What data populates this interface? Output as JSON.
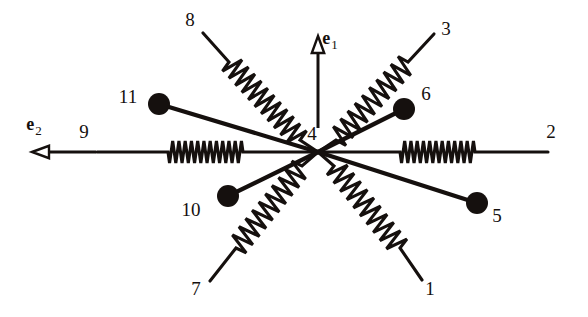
{
  "figure": {
    "background_color": "#ffffff",
    "ink_color": "#15100e",
    "width": 588,
    "height": 317
  },
  "hub": {
    "label": "4",
    "label_x": 312,
    "label_y": 140,
    "center_x": 318,
    "center_y": 152
  },
  "basis_vectors": [
    {
      "name": "e1",
      "letter": "e",
      "subscript": "1",
      "direction": "up",
      "tail_x": 318,
      "tail_y": 128,
      "head_x": 318,
      "head_y": 36,
      "letter_x": 330,
      "letter_y": 44,
      "arrowhead": "hollow-triangle"
    },
    {
      "name": "e2",
      "letter": "e",
      "subscript": "2",
      "direction": "left",
      "tail_x": 96,
      "tail_y": 152,
      "head_x": 32,
      "head_y": 152,
      "letter_x": 34,
      "letter_y": 130,
      "arrowhead": "hollow-triangle"
    }
  ],
  "springs": [
    {
      "label": "8",
      "label_x": 190,
      "label_y": 26,
      "tip_x": 203,
      "tip_y": 33,
      "coil_start_x": 229,
      "coil_start_y": 62,
      "coil_end_x": 300,
      "coil_end_y": 140,
      "hub_x": 318,
      "hub_y": 152,
      "coils": 11,
      "amplitude": 11
    },
    {
      "label": "3",
      "label_x": 446,
      "label_y": 35,
      "tip_x": 434,
      "tip_y": 34,
      "coil_start_x": 408,
      "coil_start_y": 62,
      "coil_end_x": 336,
      "coil_end_y": 140,
      "hub_x": 318,
      "hub_y": 152,
      "coils": 10,
      "amplitude": 11
    },
    {
      "label": "7",
      "label_x": 196,
      "label_y": 295,
      "tip_x": 210,
      "tip_y": 281,
      "coil_start_x": 236,
      "coil_start_y": 248,
      "coil_end_x": 302,
      "coil_end_y": 166,
      "hub_x": 318,
      "hub_y": 152,
      "coils": 10,
      "amplitude": 11
    },
    {
      "label": "1",
      "label_x": 430,
      "label_y": 295,
      "tip_x": 422,
      "tip_y": 280,
      "coil_start_x": 400,
      "coil_start_y": 248,
      "coil_end_x": 334,
      "coil_end_y": 166,
      "hub_x": 318,
      "hub_y": 152,
      "coils": 10,
      "amplitude": 11
    },
    {
      "label": "9",
      "label_x": 84,
      "label_y": 138,
      "tip_x": 97,
      "tip_y": 152,
      "coil_start_x": 168,
      "coil_start_y": 152,
      "coil_end_x": 243,
      "coil_end_y": 152,
      "hub_x": 318,
      "hub_y": 152,
      "coils": 12,
      "amplitude": 11
    },
    {
      "label": "2",
      "label_x": 551,
      "label_y": 138,
      "tip_x": 548,
      "tip_y": 152,
      "coil_start_x": 475,
      "coil_start_y": 152,
      "coil_end_x": 400,
      "coil_end_y": 152,
      "hub_x": 318,
      "hub_y": 152,
      "coils": 12,
      "amplitude": 11
    }
  ],
  "masses": [
    {
      "label": "11",
      "label_x": 128,
      "label_y": 103,
      "center_x": 159,
      "center_y": 104,
      "radius": 11,
      "hub_x": 318,
      "hub_y": 152
    },
    {
      "label": "6",
      "label_x": 426,
      "label_y": 100,
      "center_x": 404,
      "center_y": 109,
      "radius": 11,
      "hub_x": 318,
      "hub_y": 152
    },
    {
      "label": "10",
      "label_x": 191,
      "label_y": 216,
      "center_x": 228,
      "center_y": 196,
      "radius": 11,
      "hub_x": 318,
      "hub_y": 152
    },
    {
      "label": "5",
      "label_x": 497,
      "label_y": 222,
      "center_x": 477,
      "center_y": 203,
      "radius": 11,
      "hub_x": 318,
      "hub_y": 152
    }
  ]
}
